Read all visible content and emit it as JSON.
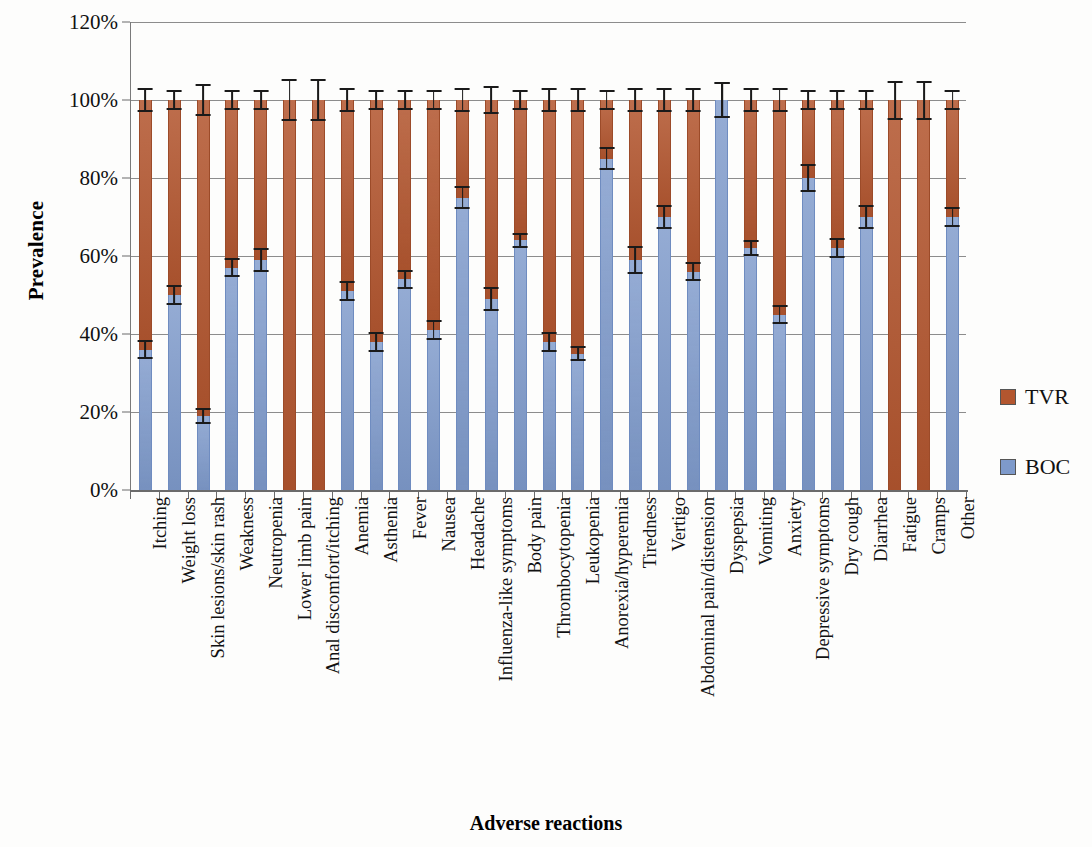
{
  "chart_data": {
    "type": "bar",
    "subtype": "stacked-bar-100-percent",
    "title": "",
    "xlabel": "Adverse reactions",
    "ylabel": "Prevalence",
    "ylim": [
      0,
      120
    ],
    "ytick_labels": [
      "0%",
      "20%",
      "40%",
      "60%",
      "80%",
      "100%",
      "120%"
    ],
    "ytick_values": [
      0,
      20,
      40,
      60,
      80,
      100,
      120
    ],
    "grid": true,
    "grid_axis": "y",
    "legend_position": "right",
    "categories": [
      "Itching",
      "Weight loss",
      "Skin lesions/skin rash",
      "Weakness",
      "Neutropenia",
      "Lower limb pain",
      "Anal discomfort/itching",
      "Anemia",
      "Asthenia",
      "Fever",
      "Nausea",
      "Headache",
      "Influenza-like symptoms",
      "Body pain",
      "Thrombocytopenia",
      "Leukopenia",
      "Anorexia/hyperemia",
      "Tiredness",
      "Vertigo",
      "Abdominal pain/distension",
      "Dyspepsia",
      "Vomiting",
      "Anxiety",
      "Depressive symptoms",
      "Dry cough",
      "Diarrhea",
      "Fatigue",
      "Cramps",
      "Other"
    ],
    "series": [
      {
        "name": "BOC",
        "color": "#7e9acb",
        "values": [
          36,
          50,
          19,
          57,
          59,
          0,
          0,
          51,
          38,
          54,
          41,
          75,
          49,
          64,
          38,
          35,
          85,
          59,
          70,
          56,
          100,
          62,
          45,
          80,
          62,
          70,
          0,
          0,
          70
        ],
        "errors": [
          2.5,
          2.5,
          2,
          2.5,
          3,
          0,
          0,
          2.5,
          2.5,
          2.5,
          2.5,
          3,
          3,
          2,
          2.5,
          2,
          3,
          3.5,
          3,
          2.5,
          4.5,
          2,
          2.5,
          3.5,
          2.5,
          3,
          0,
          0,
          2.5
        ]
      },
      {
        "name": "TVR",
        "color": "#b3562f",
        "values": [
          64,
          50,
          81,
          43,
          41,
          100,
          100,
          49,
          62,
          46,
          59,
          25,
          51,
          36,
          62,
          65,
          15,
          41,
          30,
          44,
          0,
          38,
          55,
          20,
          38,
          30,
          100,
          100,
          30
        ],
        "totals": [
          100,
          100,
          100,
          100,
          100,
          100,
          100,
          100,
          100,
          100,
          100,
          100,
          100,
          100,
          100,
          100,
          100,
          100,
          100,
          100,
          100,
          100,
          100,
          100,
          100,
          100,
          100,
          100,
          100
        ],
        "errors": [
          3,
          2.5,
          4,
          2.5,
          2.5,
          5.5,
          5.5,
          3,
          2.5,
          2.5,
          2.5,
          3,
          3.5,
          2.5,
          3,
          3,
          2.5,
          3,
          3,
          3,
          4.5,
          3,
          3,
          2.5,
          2.5,
          2.5,
          5,
          5,
          2.5
        ]
      }
    ]
  },
  "legend": {
    "entries": [
      {
        "label": "TVR",
        "color": "#b3562f"
      },
      {
        "label": "BOC",
        "color": "#7e9acb"
      }
    ]
  },
  "axes": {
    "y_title": "Prevalence",
    "x_title": "Adverse reactions"
  }
}
